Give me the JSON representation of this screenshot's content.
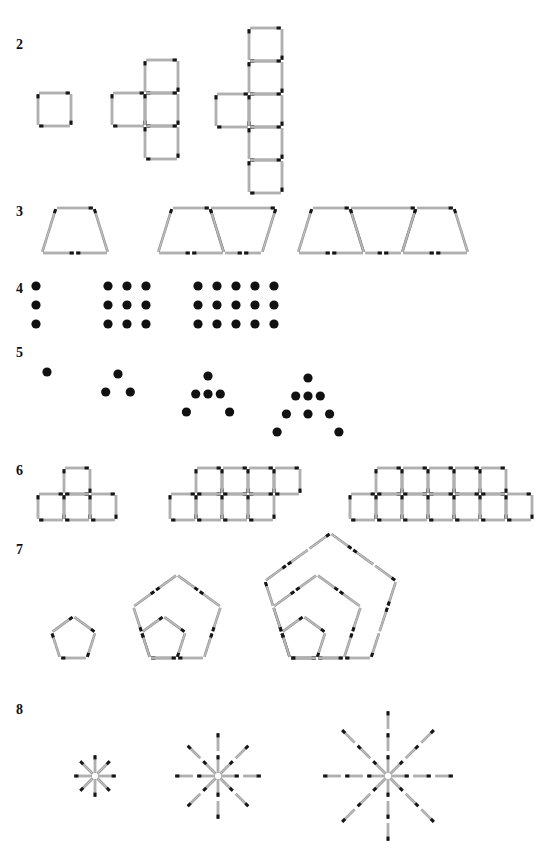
{
  "page": {
    "width": 555,
    "height": 849,
    "background": "#ffffff",
    "ink_color": "#111111",
    "match_stick_color": "#bdbdbd",
    "match_head_color": "#151515"
  },
  "rows": [
    {
      "label": "2",
      "label_x": 16,
      "label_y": 38,
      "kind": "matchstick-squares",
      "description": "Squares built from matchsticks: 1 square, then 4 squares in a plus arrangement, then 6 squares in a cross/column arrangement",
      "figures": [
        {
          "term": 1,
          "squares": 1,
          "matches": 4
        },
        {
          "term": 2,
          "squares": 4,
          "matches": 13
        },
        {
          "term": 3,
          "squares": 6,
          "matches": 19
        }
      ]
    },
    {
      "label": "3",
      "label_x": 16,
      "label_y": 216,
      "kind": "matchstick-trapezoids",
      "description": "Trapezoids joined side by side, alternating orientation",
      "figures": [
        {
          "term": 1,
          "trapezoids": 1,
          "matches": 5
        },
        {
          "term": 2,
          "trapezoids": 2,
          "matches": 9
        },
        {
          "term": 3,
          "trapezoids": 3,
          "matches": 13
        }
      ]
    },
    {
      "label": "4",
      "label_x": 16,
      "label_y": 292,
      "kind": "dot-grid",
      "description": "Rectangular arrays of dots, three rows tall, widening by two columns",
      "figures": [
        {
          "term": 1,
          "columns": 1,
          "rows": 3,
          "dots": 3
        },
        {
          "term": 2,
          "columns": 3,
          "rows": 3,
          "dots": 9
        },
        {
          "term": 3,
          "columns": 5,
          "rows": 3,
          "dots": 15
        }
      ]
    },
    {
      "label": "5",
      "label_x": 16,
      "label_y": 355,
      "kind": "dot-tree",
      "description": "Dot trees: a vertical stem that forks into two branches",
      "figures": [
        {
          "term": 1,
          "dots": 1
        },
        {
          "term": 2,
          "dots": 4
        },
        {
          "term": 3,
          "dots": 7
        },
        {
          "term": 4,
          "dots": 10
        }
      ]
    },
    {
      "label": "6",
      "label_x": 16,
      "label_y": 473,
      "kind": "matchstick-tetrominoes",
      "description": "T-shaped tetromino outlines tiled in a strip",
      "figures": [
        {
          "term": 1,
          "tees": 1,
          "matches": 10
        },
        {
          "term": 2,
          "tees": 2,
          "matches": 18
        },
        {
          "term": 3,
          "tees": 3,
          "matches": 26
        }
      ]
    },
    {
      "label": "7",
      "label_x": 16,
      "label_y": 552,
      "kind": "matchstick-pentagons",
      "description": "Nested pentagons sharing a base, each ring one matchstick longer per side",
      "figures": [
        {
          "term": 1,
          "pentagons": 1,
          "side_matches": 1,
          "matches": 5
        },
        {
          "term": 2,
          "pentagons": 2,
          "side_matches": 2,
          "matches": 15
        },
        {
          "term": 3,
          "pentagons": 3,
          "side_matches": 3,
          "matches": 30
        }
      ]
    },
    {
      "label": "8",
      "label_x": 16,
      "label_y": 712,
      "kind": "matchstick-stars",
      "description": "Eight-pointed stars; each ray grows by one matchstick",
      "figures": [
        {
          "term": 1,
          "rays": 8,
          "matches_per_ray": 1,
          "matches": 8
        },
        {
          "term": 2,
          "rays": 8,
          "matches_per_ray": 2,
          "matches": 16
        },
        {
          "term": 3,
          "rays": 8,
          "matches_per_ray": 3,
          "matches": 24
        }
      ]
    }
  ]
}
